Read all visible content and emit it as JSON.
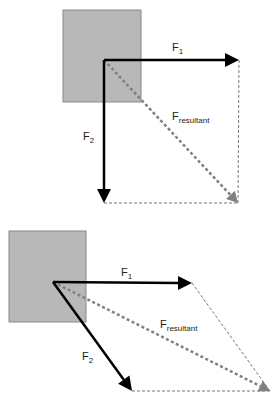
{
  "diagrams": [
    {
      "name": "perpendicular-forces",
      "box": {
        "x": 63,
        "y": 10,
        "w": 78,
        "h": 92,
        "fill": "#b8b8b8",
        "stroke": "#888888"
      },
      "origin": [
        104,
        60
      ],
      "f1": {
        "tip": [
          239,
          60
        ],
        "label": "F",
        "sub": "1",
        "label_pos": [
          172,
          51
        ]
      },
      "f2": {
        "tip": [
          104,
          203
        ],
        "label": "F",
        "sub": "2",
        "label_pos": [
          83,
          140
        ]
      },
      "resultant": {
        "tip": [
          238,
          203
        ],
        "label": "F",
        "sub": "resultant",
        "label_pos": [
          172,
          120
        ]
      }
    },
    {
      "name": "angled-forces",
      "box": {
        "x": 9,
        "y": 231,
        "w": 77,
        "h": 91,
        "fill": "#b8b8b8",
        "stroke": "#888888"
      },
      "origin": [
        53,
        282
      ],
      "f1": {
        "tip": [
          192,
          283
        ],
        "label": "F",
        "sub": "1",
        "label_pos": [
          121,
          276
        ]
      },
      "f2": {
        "tip": [
          132,
          391
        ],
        "label": "F",
        "sub": "2",
        "label_pos": [
          82,
          360
        ]
      },
      "resultant": {
        "tip": [
          270,
          391
        ],
        "label": "F",
        "sub": "resultant",
        "label_pos": [
          160,
          328
        ]
      }
    }
  ],
  "colors": {
    "force": "#000000",
    "resultant": "#808080",
    "construction": "#777777"
  }
}
